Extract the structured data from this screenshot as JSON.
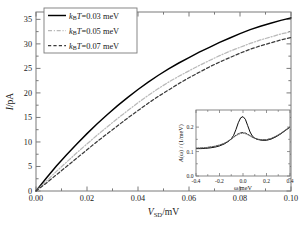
{
  "figure": {
    "background": "#ffffff",
    "frame_color": "#7a7a7a"
  },
  "chart_data": {
    "type": "line",
    "title": "",
    "xlabel": "V_SD/mV",
    "ylabel": "I/pA",
    "xlabel_parts": {
      "main": "V",
      "sub": "SD",
      "unit": "/mV"
    },
    "ylabel_parts": {
      "main": "I",
      "unit": "/pA"
    },
    "xlim": [
      0.0,
      0.1
    ],
    "ylim": [
      0.0,
      36.5
    ],
    "xticks": [
      0.0,
      0.02,
      0.04,
      0.06,
      0.08,
      0.1
    ],
    "xticklabels": [
      "0.00",
      "0.02",
      "0.04",
      "0.06",
      "0.08",
      "0.10"
    ],
    "yticks": [
      0,
      5,
      10,
      15,
      20,
      25,
      30,
      35
    ],
    "yticklabels": [
      "0",
      "5",
      "10",
      "15",
      "20",
      "25",
      "30",
      "35"
    ],
    "minor_x_per_major": 2,
    "minor_y_per_major": 2,
    "grid": false,
    "legend_position": "upper left",
    "series": [
      {
        "name": "kBT=0.03 meV",
        "label_parts": {
          "k": "k",
          "sub": "B",
          "T": "T",
          "eq": "=0.03 meV"
        },
        "style": "solid",
        "color": "#000000",
        "x": [
          0.0,
          0.004,
          0.008,
          0.012,
          0.016,
          0.02,
          0.024,
          0.028,
          0.032,
          0.036,
          0.04,
          0.044,
          0.048,
          0.052,
          0.056,
          0.06,
          0.064,
          0.068,
          0.072,
          0.076,
          0.08,
          0.084,
          0.088,
          0.092,
          0.096,
          0.1
        ],
        "y": [
          0.0,
          2.6,
          5.1,
          7.4,
          9.6,
          11.7,
          13.7,
          15.6,
          17.4,
          19.1,
          20.7,
          22.2,
          23.6,
          24.9,
          26.1,
          27.2,
          28.3,
          29.3,
          30.3,
          31.2,
          32.1,
          32.9,
          33.6,
          34.2,
          34.8,
          35.3
        ]
      },
      {
        "name": "kBT=0.05 meV",
        "label_parts": {
          "k": "k",
          "sub": "B",
          "T": "T",
          "eq": "=0.05 meV"
        },
        "style": "dashdot",
        "color": "#b9b9b9",
        "x": [
          0.0,
          0.004,
          0.008,
          0.012,
          0.016,
          0.02,
          0.024,
          0.028,
          0.032,
          0.036,
          0.04,
          0.044,
          0.048,
          0.052,
          0.056,
          0.06,
          0.064,
          0.068,
          0.072,
          0.076,
          0.08,
          0.084,
          0.088,
          0.092,
          0.096,
          0.1
        ],
        "y": [
          0.0,
          2.0,
          4.0,
          5.9,
          7.8,
          9.6,
          11.4,
          13.1,
          14.8,
          16.4,
          18.0,
          19.5,
          20.9,
          22.2,
          23.4,
          24.5,
          25.6,
          26.6,
          27.6,
          28.5,
          29.3,
          30.1,
          30.8,
          31.4,
          32.0,
          32.5
        ]
      },
      {
        "name": "kBT=0.07 meV",
        "label_parts": {
          "k": "k",
          "sub": "B",
          "T": "T",
          "eq": "=0.07 meV"
        },
        "style": "dashed",
        "color": "#3b3b3b",
        "x": [
          0.0,
          0.004,
          0.008,
          0.012,
          0.016,
          0.02,
          0.024,
          0.028,
          0.032,
          0.036,
          0.04,
          0.044,
          0.048,
          0.052,
          0.056,
          0.06,
          0.064,
          0.068,
          0.072,
          0.076,
          0.08,
          0.084,
          0.088,
          0.092,
          0.096,
          0.1
        ],
        "y": [
          0.0,
          1.6,
          3.3,
          5.0,
          6.7,
          8.4,
          10.1,
          11.7,
          13.3,
          14.9,
          16.4,
          17.9,
          19.3,
          20.6,
          21.9,
          23.1,
          24.2,
          25.3,
          26.3,
          27.2,
          28.1,
          28.9,
          29.6,
          30.2,
          30.8,
          31.3
        ]
      }
    ]
  },
  "inset": {
    "type": "line",
    "xlabel": "ω/meV",
    "ylabel": "A(ω) / (1/meV)",
    "ylabel_parts": {
      "a": "A",
      "omega": "(ω)",
      "slash": " / (1/meV)"
    },
    "xlim": [
      -0.4,
      0.4
    ],
    "ylim": [
      0.0,
      0.27
    ],
    "xticks": [
      -0.4,
      -0.2,
      0.0,
      0.2,
      0.4
    ],
    "xticklabels": [
      "-0.4",
      "-0.2",
      "0.0",
      "0.2",
      "0.4"
    ],
    "yticks": [
      0.0,
      0.1,
      0.2
    ],
    "yticklabels": [
      "0.0",
      "0.1",
      "0.2"
    ],
    "series": [
      {
        "name": "A solid",
        "style": "solid",
        "color": "#000000",
        "x": [
          -0.4,
          -0.36,
          -0.32,
          -0.28,
          -0.24,
          -0.2,
          -0.16,
          -0.12,
          -0.1,
          -0.08,
          -0.06,
          -0.04,
          -0.02,
          0.0,
          0.02,
          0.04,
          0.06,
          0.08,
          0.1,
          0.12,
          0.16,
          0.2,
          0.24,
          0.28,
          0.32,
          0.36,
          0.4
        ],
        "y": [
          0.112,
          0.112,
          0.113,
          0.115,
          0.118,
          0.123,
          0.131,
          0.143,
          0.152,
          0.166,
          0.19,
          0.218,
          0.238,
          0.243,
          0.232,
          0.206,
          0.18,
          0.163,
          0.155,
          0.15,
          0.146,
          0.146,
          0.151,
          0.16,
          0.172,
          0.186,
          0.2
        ]
      },
      {
        "name": "A dashed",
        "style": "dashed",
        "color": "#2e2e2e",
        "x": [
          -0.4,
          -0.36,
          -0.32,
          -0.28,
          -0.24,
          -0.2,
          -0.16,
          -0.12,
          -0.1,
          -0.08,
          -0.06,
          -0.04,
          -0.02,
          0.0,
          0.02,
          0.04,
          0.06,
          0.08,
          0.1,
          0.12,
          0.16,
          0.2,
          0.24,
          0.28,
          0.32,
          0.36,
          0.4
        ],
        "y": [
          0.113,
          0.114,
          0.115,
          0.118,
          0.121,
          0.126,
          0.133,
          0.144,
          0.151,
          0.159,
          0.167,
          0.173,
          0.177,
          0.178,
          0.176,
          0.171,
          0.165,
          0.159,
          0.155,
          0.151,
          0.148,
          0.148,
          0.153,
          0.162,
          0.173,
          0.187,
          0.2
        ]
      },
      {
        "name": "A dotted",
        "style": "dotted",
        "color": "#6b6b6b",
        "x": [
          -0.4,
          -0.36,
          -0.32,
          -0.28,
          -0.24,
          -0.2,
          -0.16,
          -0.12,
          -0.1,
          -0.08,
          -0.06,
          -0.04,
          -0.02,
          0.0,
          0.02,
          0.04,
          0.06,
          0.08,
          0.1,
          0.12,
          0.16,
          0.2,
          0.24,
          0.28,
          0.32,
          0.36,
          0.4
        ],
        "y": [
          0.114,
          0.115,
          0.116,
          0.119,
          0.122,
          0.127,
          0.134,
          0.145,
          0.151,
          0.158,
          0.165,
          0.17,
          0.174,
          0.175,
          0.173,
          0.169,
          0.164,
          0.158,
          0.154,
          0.151,
          0.148,
          0.149,
          0.154,
          0.163,
          0.174,
          0.188,
          0.201
        ]
      }
    ]
  }
}
